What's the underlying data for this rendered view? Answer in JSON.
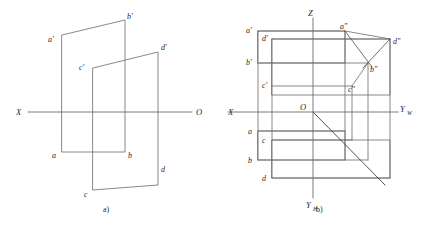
{
  "figure": {
    "background": "#ffffff",
    "line_color": "#6b6b6b",
    "heavy_line_color": "#3d3d3d",
    "label_color": "#262626",
    "captions": [
      {
        "id": "a",
        "text": "a)"
      },
      {
        "id": "b",
        "text": "b)"
      }
    ]
  },
  "panel_a": {
    "title": "a)",
    "description": "pictorial view of two parallel planes",
    "axis_labels": {
      "x": "X",
      "origin": "O"
    },
    "point_labels": [
      {
        "name": "a-prime",
        "text": "a′"
      },
      {
        "name": "b-prime",
        "text": "b′"
      },
      {
        "name": "c-prime",
        "text": "c′"
      },
      {
        "name": "d-prime",
        "text": "d′"
      },
      {
        "name": "a",
        "text": "a"
      },
      {
        "name": "b",
        "text": "b"
      },
      {
        "name": "c",
        "text": "c"
      },
      {
        "name": "d",
        "text": "d"
      }
    ]
  },
  "panel_b": {
    "title": "b)",
    "description": "unfolded three-view orthographic projection",
    "axis_labels": {
      "x": "X",
      "z": "Z",
      "origin": "O",
      "y_w": "Y",
      "y_w_sub": "W",
      "y_h": "Y",
      "y_h_sub": "H"
    },
    "point_labels": [
      {
        "name": "a-prime",
        "text": "a′"
      },
      {
        "name": "d-prime",
        "text": "d′"
      },
      {
        "name": "b-prime",
        "text": "b′"
      },
      {
        "name": "c-prime",
        "text": "c′"
      },
      {
        "name": "a-double-prime",
        "text": "a″"
      },
      {
        "name": "d-double-prime",
        "text": "d″"
      },
      {
        "name": "b-double-prime",
        "text": "b″"
      },
      {
        "name": "c-double-prime",
        "text": "c″"
      },
      {
        "name": "a",
        "text": "a"
      },
      {
        "name": "c",
        "text": "c"
      },
      {
        "name": "b",
        "text": "b"
      },
      {
        "name": "d",
        "text": "d"
      }
    ]
  }
}
